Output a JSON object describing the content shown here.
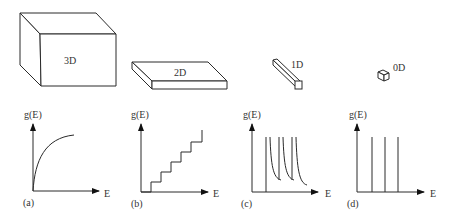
{
  "structures": [
    {
      "label": "3D"
    },
    {
      "label": "2D"
    },
    {
      "label": "1D"
    },
    {
      "label": "0D"
    }
  ],
  "plots": [
    {
      "panel": "(a)",
      "ylabel": "g(E)",
      "xlabel": "E",
      "shape": "square-root curve"
    },
    {
      "panel": "(b)",
      "ylabel": "g(E)",
      "xlabel": "E",
      "shape": "staircase"
    },
    {
      "panel": "(c)",
      "ylabel": "g(E)",
      "xlabel": "E",
      "shape": "inverse square-root spikes"
    },
    {
      "panel": "(d)",
      "ylabel": "g(E)",
      "xlabel": "E",
      "shape": "delta functions"
    }
  ]
}
